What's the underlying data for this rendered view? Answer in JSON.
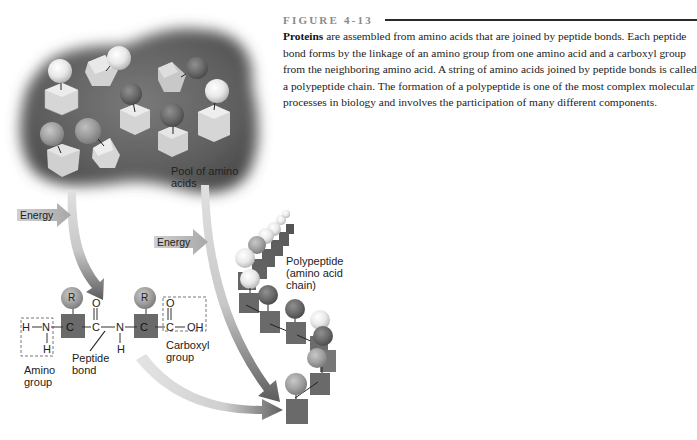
{
  "figure": {
    "number_label": "FIGURE 4-13",
    "caption_bold": "Proteins",
    "caption_text": " are assembled from amino acids that are joined by peptide bonds. Each peptide bond forms by the linkage of an amino group from one amino acid and a carboxyl group from the neighboring amino acid. A string of amino acids joined by peptide bonds is called a polypeptide chain. The formation of a polypeptide is one of the most complex molecular processes in biology and involves the participation of many different components."
  },
  "diagram": {
    "pool_label_line1": "Pool of amino",
    "pool_label_line2": "acids",
    "energy_label_1": "Energy",
    "energy_label_2": "Energy",
    "polypeptide_label_line1": "Polypeptide",
    "polypeptide_label_line2": "(amino acid",
    "polypeptide_label_line3": "chain)",
    "chem": {
      "H_left": "H",
      "N1": "N",
      "H_below_N1": "H",
      "C1": "C",
      "R1": "R",
      "C2": "C",
      "O1": "O",
      "N2": "N",
      "H_below_N2": "H",
      "C3": "C",
      "R2": "R",
      "C4": "C",
      "O2": "O",
      "OH": "OH"
    },
    "amino_group_label_line1": "Amino",
    "amino_group_label_line2": "group",
    "peptide_bond_label_line1": "Peptide",
    "peptide_bond_label_line2": "bond",
    "carboxyl_group_label_line1": "Carboxyl",
    "carboxyl_group_label_line2": "group"
  },
  "colors": {
    "cloud": "#6b6b6b",
    "arrow_light": "#d8d8d8",
    "arrow_dark": "#6e6e6e",
    "block": "#6a6a6a",
    "rule": "#2a2a2a"
  }
}
